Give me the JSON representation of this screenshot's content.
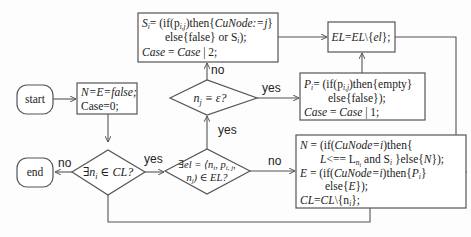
{
  "diagram": {
    "type": "flowchart",
    "nodes": {
      "start": {
        "label": "start"
      },
      "end": {
        "label": "end"
      },
      "init": {
        "line1": "N=E=false;",
        "line2": "Case=0;"
      },
      "cond_cl": {
        "label": "∃n",
        "sub": "i",
        "rest": " ∈ CL?"
      },
      "cond_el": {
        "line1": "∃el = ⟨n",
        "line2": "n",
        "line2_rest": ") ∈ EL?",
        "p": "p",
        "p_sub": "i, j",
        "sep": ", "
      },
      "cond_nj": {
        "label": "n",
        "sub": "j",
        "rest": " ≡ ε?"
      },
      "s_box": {
        "line1a": "S",
        "line1b": "i",
        "line1c": "= (if(p",
        "line1d": "i,j",
        "line1e": ")then{",
        "line1f": "CuNode:=j",
        "line1g": "}",
        "line2a": "else{false} or S",
        "line2b": "i",
        "line2c": ");",
        "line3a": "Case",
        "line3b": " = ",
        "line3c": "Case",
        "line3d": " | 2;"
      },
      "el_box": {
        "label_a": "EL",
        "label_b": "=",
        "label_c": "EL",
        "label_d": "\\{",
        "label_e": "el",
        "label_f": "};"
      },
      "p_box": {
        "line1a": "P",
        "line1b": "i",
        "line1c": "= (if(p",
        "line1d": "i,j",
        "line1e": ")then{empty}",
        "line2": "else{false});",
        "line3a": "Case",
        "line3b": " = ",
        "line3c": "Case",
        "line3d": " | 1;"
      },
      "n_box": {
        "line1a": "N",
        "line1b": " = (if(",
        "line1c": "CuNode=i",
        "line1d": ")then{",
        "line2a": "L",
        "line2b": "<== L",
        "line2c": "n",
        "line2d": "i",
        "line2e": " and S",
        "line2f": "i",
        "line2g": " }else{",
        "line2h": "N",
        "line2i": "});",
        "line3a": "E",
        "line3b": " = (if(",
        "line3c": "CuNode=i",
        "line3d": ")then{",
        "line3e": "P",
        "line3f": "i",
        "line3g": "}",
        "line4a": "else{",
        "line4b": "E",
        "line4c": "});",
        "line5a": "CL",
        "line5b": "=",
        "line5c": "CL",
        "line5d": "\\{n",
        "line5e": "i",
        "line5f": "};"
      }
    },
    "edge_labels": {
      "cl_no": "no",
      "cl_yes": "yes",
      "el_yes": "yes",
      "el_no": "no",
      "nj_no": "no",
      "nj_yes": "yes"
    },
    "colors": {
      "stroke": "#555555",
      "text": "#222222",
      "background": "#fdfdfd"
    }
  }
}
